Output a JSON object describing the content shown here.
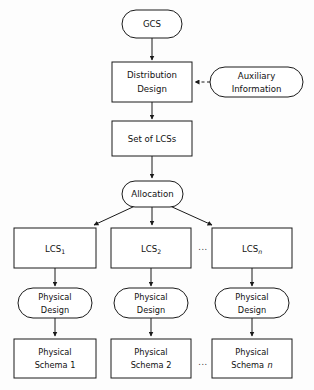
{
  "diagram": {
    "background_color": "#fdfdfd",
    "stroke_color": "#1a1a1a",
    "fill_color": "#ffffff",
    "text_color": "#111111",
    "nodes": {
      "gcs": {
        "label": "GCS",
        "shape": "rounded"
      },
      "distribution_design": {
        "line1": "Distribution",
        "line2": "Design",
        "shape": "rect"
      },
      "auxiliary_information": {
        "line1": "Auxiliary",
        "line2": "Information",
        "shape": "rounded"
      },
      "set_of_lcss": {
        "label": "Set of LCSs",
        "shape": "rect"
      },
      "allocation": {
        "label": "Allocation",
        "shape": "rounded"
      },
      "lcs1": {
        "base": "LCS",
        "subscript": "1",
        "shape": "rect"
      },
      "lcs2": {
        "base": "LCS",
        "subscript": "2",
        "shape": "rect"
      },
      "lcsn": {
        "base": "LCS",
        "subscript": "n",
        "shape": "rect"
      },
      "physical_design_1": {
        "line1": "Physical",
        "line2": "Design",
        "shape": "rounded"
      },
      "physical_design_2": {
        "line1": "Physical",
        "line2": "Design",
        "shape": "rounded"
      },
      "physical_design_n": {
        "line1": "Physical",
        "line2": "Design",
        "shape": "rounded"
      },
      "physical_schema_1": {
        "line1": "Physical",
        "line2": "Schema 1",
        "shape": "rect"
      },
      "physical_schema_2": {
        "line1": "Physical",
        "line2": "Schema 2",
        "shape": "rect"
      },
      "physical_schema_n": {
        "line1": "Physical",
        "line2": "Schema",
        "suffix": "n",
        "shape": "rect"
      }
    },
    "ellipses": {
      "lcs_row": "...",
      "schema_row": "..."
    },
    "edges": [
      {
        "from": "gcs",
        "to": "distribution_design",
        "style": "solid",
        "arrow": true
      },
      {
        "from": "auxiliary_information",
        "to": "distribution_design",
        "style": "dashed",
        "arrow": true
      },
      {
        "from": "distribution_design",
        "to": "set_of_lcss",
        "style": "solid",
        "arrow": true
      },
      {
        "from": "set_of_lcss",
        "to": "allocation",
        "style": "solid",
        "arrow": true
      },
      {
        "from": "allocation",
        "to": "lcs1",
        "style": "solid",
        "arrow": true
      },
      {
        "from": "allocation",
        "to": "lcs2",
        "style": "solid",
        "arrow": true
      },
      {
        "from": "allocation",
        "to": "lcsn",
        "style": "solid",
        "arrow": true
      },
      {
        "from": "lcs1",
        "to": "physical_design_1",
        "style": "solid",
        "arrow": true
      },
      {
        "from": "lcs2",
        "to": "physical_design_2",
        "style": "solid",
        "arrow": true
      },
      {
        "from": "lcsn",
        "to": "physical_design_n",
        "style": "solid",
        "arrow": true
      },
      {
        "from": "physical_design_1",
        "to": "physical_schema_1",
        "style": "solid",
        "arrow": true
      },
      {
        "from": "physical_design_2",
        "to": "physical_schema_2",
        "style": "solid",
        "arrow": true
      },
      {
        "from": "physical_design_n",
        "to": "physical_schema_n",
        "style": "solid",
        "arrow": true
      }
    ]
  }
}
